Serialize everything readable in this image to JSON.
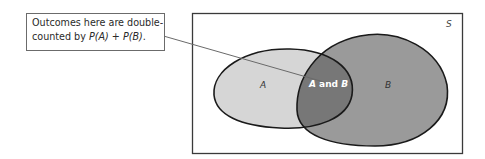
{
  "callout": {
    "line1": "Outcomes here are double-",
    "line2_prefix": "counted by ",
    "line2_pa": "P(A)",
    "line2_plus": " + ",
    "line2_pb": "P(B)",
    "line2_suffix": "."
  },
  "sample_space": {
    "label": "S"
  },
  "sets": {
    "a": {
      "label": "A",
      "fill": "#d6d6d6"
    },
    "b": {
      "label": "B",
      "fill": "#9a9a9a"
    },
    "intersection": {
      "label_a": "A",
      "label_and": " and ",
      "label_b": "B",
      "fill": "#7a7a7a"
    }
  },
  "colors": {
    "outline": "#1a1a1a",
    "box": "#3a3a3a",
    "connector": "#6a6a6a"
  }
}
